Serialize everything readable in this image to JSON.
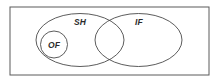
{
  "diagram": {
    "type": "euler-venn",
    "background_color": "#ffffff",
    "stroke_color": "#4a4a4a",
    "border_color": "#5a5a5a",
    "label_color": "#2b2b2b",
    "universe": {
      "name": "universe-rectangle",
      "x": 10,
      "y": 7,
      "width": 199,
      "height": 68
    },
    "sets": [
      {
        "id": "sh",
        "label": "SH",
        "shape": "ellipse",
        "cx": 80,
        "cy": 40,
        "rx": 44,
        "ry": 26.5,
        "label_x": 80,
        "label_y": 25
      },
      {
        "id": "if",
        "label": "IF",
        "shape": "ellipse",
        "cx": 138.5,
        "cy": 40,
        "rx": 43.5,
        "ry": 26.5,
        "label_x": 139,
        "label_y": 25
      },
      {
        "id": "of",
        "label": "OF",
        "shape": "circle",
        "cx": 54,
        "cy": 44.5,
        "r": 13.5,
        "label_x": 54,
        "label_y": 47.5
      }
    ]
  }
}
